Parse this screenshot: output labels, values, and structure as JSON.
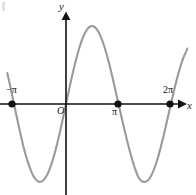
{
  "figure": {
    "width": 196,
    "height": 195,
    "background": "#ffffff",
    "curve_color": "#9a9a9a",
    "axis_color": "#111111",
    "point_color": "#111111"
  },
  "labels": {
    "y_axis": "y",
    "x_axis": "x",
    "origin": "O",
    "tick_neg_pi": "−π",
    "tick_pi": "π",
    "tick_two_pi": "2π"
  },
  "chart_data": {
    "type": "line",
    "title": "",
    "xlabel": "x",
    "ylabel": "y",
    "function": "y = sin(x)",
    "grid": false,
    "legend": null,
    "xlim": [
      -3.5449,
      7.3304
    ],
    "ylim": [
      -1.17,
      1.17
    ],
    "x_ticks": [
      -3.14159,
      0,
      3.14159,
      6.28319
    ],
    "x_tick_labels": [
      "−π",
      "O",
      "π",
      "2π"
    ],
    "y_ticks": [],
    "y_tick_labels": [],
    "marked_points": [
      {
        "x": -3.14159,
        "y": 0,
        "label": "−π"
      },
      {
        "x": 3.14159,
        "y": 0,
        "label": "π"
      },
      {
        "x": 6.28319,
        "y": 0,
        "label": "2π"
      }
    ],
    "extrema": [
      {
        "x": -1.5708,
        "y": -1,
        "type": "minimum"
      },
      {
        "x": 1.5708,
        "y": 1,
        "type": "maximum"
      },
      {
        "x": 4.71239,
        "y": -1,
        "type": "minimum"
      }
    ],
    "zeros": [
      -3.14159,
      0,
      3.14159,
      6.28319
    ],
    "series": [
      {
        "name": "sin(x)",
        "color": "#9a9a9a",
        "x": [
          -3.5449,
          -3.4249,
          -3.3049,
          -3.1849,
          -3.0649,
          -2.9449,
          -2.8249,
          -2.7049,
          -2.5849,
          -2.4649,
          -2.3449,
          -2.2249,
          -2.1049,
          -1.9849,
          -1.8649,
          -1.7449,
          -1.6249,
          -1.5049,
          -1.3849,
          -1.2649,
          -1.1449,
          -1.0249,
          -0.9049,
          -0.7849,
          -0.6649,
          -0.5449,
          -0.4249,
          -0.3049,
          -0.1849,
          -0.0649,
          0.0551,
          0.1751,
          0.2951,
          0.4151,
          0.5351,
          0.6551,
          0.7751,
          0.8951,
          1.0151,
          1.1351,
          1.2551,
          1.3751,
          1.4951,
          1.6151,
          1.7351,
          1.8551,
          1.9751,
          2.0951,
          2.2151,
          2.3351,
          2.4551,
          2.5751,
          2.6951,
          2.8151,
          2.9351,
          3.0551,
          3.1751,
          3.2951,
          3.4151,
          3.5351,
          3.6551,
          3.7751,
          3.8951,
          4.0151,
          4.1351,
          4.2551,
          4.3751,
          4.4951,
          4.6151,
          4.7351,
          4.8551,
          4.9751,
          5.0951,
          5.2151,
          5.3351,
          5.4551,
          5.5751,
          5.6951,
          5.8151,
          5.9351,
          6.0551,
          6.1751,
          6.2951,
          6.4151,
          6.5351,
          6.6551,
          6.7751,
          6.8951,
          7.0151,
          7.1351,
          7.2551,
          7.3304
        ],
        "y": [
          0.3986,
          0.2827,
          0.1642,
          0.0434,
          -0.0766,
          -0.1954,
          -0.3123,
          -0.4261,
          -0.5358,
          -0.6308,
          -0.7166,
          -0.7933,
          -0.8607,
          -0.9177,
          -0.9569,
          -0.985,
          -0.9984,
          -0.9975,
          -0.9825,
          -0.9535,
          -0.9108,
          -0.855,
          -0.7866,
          -0.7065,
          -0.6172,
          -0.5182,
          -0.4122,
          -0.3002,
          -0.1838,
          -0.0649,
          0.0551,
          0.1742,
          0.2908,
          0.4034,
          0.51,
          0.6093,
          0.7,
          0.7805,
          0.8496,
          0.9063,
          0.9498,
          0.9811,
          0.9972,
          0.999,
          0.9866,
          0.9601,
          0.9198,
          0.8665,
          0.8012,
          0.7247,
          0.6385,
          0.5439,
          0.4424,
          0.3357,
          0.2254,
          0.1134,
          0.0004,
          -0.1125,
          -0.2241,
          -0.333,
          -0.4387,
          -0.5398,
          -0.6353,
          -0.7241,
          -0.8052,
          -0.8777,
          -0.9408,
          -0.9739,
          -0.9952,
          -0.9989,
          -0.9929,
          -0.9743,
          -0.9393,
          -0.8906,
          -0.8289,
          -0.7553,
          -0.6713,
          -0.5784,
          -0.4781,
          -0.3724,
          -0.2629,
          -0.1516,
          -0.0402,
          0.0709,
          0.1792,
          0.2828,
          0.3798,
          0.4686,
          0.5477,
          0.6159,
          0.6719,
          0.7106
        ]
      }
    ]
  },
  "geometry": {
    "origin_px": {
      "x": 66,
      "y": 104
    },
    "x_axis_y": 104,
    "y_axis_x": 66,
    "x_unit_px": 16.55,
    "amplitude_px": 78
  }
}
